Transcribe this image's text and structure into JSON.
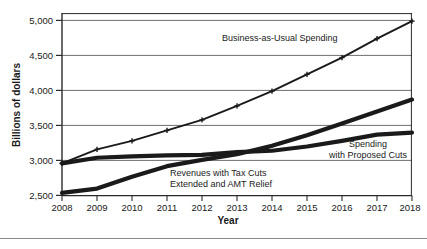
{
  "chart_data": {
    "type": "line",
    "title": "",
    "xlabel": "Year",
    "ylabel": "Billions of dollars",
    "categories": [
      "2008",
      "2009",
      "2010",
      "2011",
      "2012",
      "2013",
      "2014",
      "2015",
      "2016",
      "2017",
      "2018"
    ],
    "x": [
      2008,
      2009,
      2010,
      2011,
      2012,
      2013,
      2014,
      2015,
      2016,
      2017,
      2018
    ],
    "xlim": [
      2008,
      2018
    ],
    "ylim": [
      2500,
      5000
    ],
    "yticks": [
      2500,
      3000,
      3500,
      4000,
      4500,
      5000
    ],
    "ytick_labels": [
      "2,500",
      "3,000",
      "3,500",
      "4,000",
      "4,500",
      "5,000"
    ],
    "grid": "horizontal",
    "legend": "inline-annotations",
    "series": [
      {
        "name": "Business-as-Usual Spending",
        "marker": "plus",
        "values": [
          2960,
          3160,
          3280,
          3430,
          3580,
          3780,
          3990,
          4230,
          4470,
          4740,
          4990
        ]
      },
      {
        "name": "Spending with Proposed Cuts",
        "marker": "none",
        "values": [
          2960,
          3040,
          3060,
          3075,
          3080,
          3120,
          3140,
          3200,
          3280,
          3370,
          3400
        ]
      },
      {
        "name": "Revenues with Tax Cuts Extended and AMT Relief",
        "marker": "none",
        "values": [
          2540,
          2600,
          2770,
          2920,
          3010,
          3090,
          3210,
          3360,
          3530,
          3700,
          3870
        ]
      }
    ],
    "annotations": [
      {
        "text": "Business-as-Usual Spending",
        "x_px": 222,
        "y_px": 41
      },
      {
        "text": "Spending",
        "x_px": 366,
        "y_px": 146
      },
      {
        "text": "with Proposed Cuts",
        "x_px": 366,
        "y_px": 157
      },
      {
        "text": "Revenues with Tax Cuts",
        "x_px": 170,
        "y_px": 175
      },
      {
        "text": "Extended and AMT Relief",
        "x_px": 170,
        "y_px": 186
      }
    ]
  },
  "axis": {
    "y_title": "Billions of dollars",
    "x_title": "Year",
    "y_tick_labels": [
      "5,000",
      "4,500",
      "4,000",
      "3,500",
      "3,000",
      "2,500"
    ],
    "x_tick_labels": [
      "2008",
      "2009",
      "2010",
      "2011",
      "2012",
      "2013",
      "2014",
      "2015",
      "2016",
      "2017",
      "2018"
    ]
  },
  "annotations": {
    "business_as_usual": "Business-as-Usual Spending",
    "spending_line1": "Spending",
    "spending_line2": "with Proposed Cuts",
    "revenues_line1": "Revenues with Tax Cuts",
    "revenues_line2": "Extended and AMT Relief"
  },
  "colors": {
    "series_line": "#1a1a1a",
    "gridline": "#6e6e6e",
    "axis": "#2b2b2b",
    "background": "#ffffff",
    "rule": "#8a8a8a"
  }
}
